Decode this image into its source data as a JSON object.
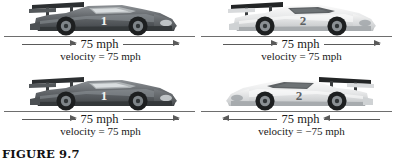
{
  "figure": {
    "caption": "FIGURE 9.7",
    "background_color": "#ffffff",
    "line_color": "#6e6e6e",
    "arrow_color": "#5a5a5a"
  },
  "panels": [
    {
      "id": "top-left",
      "car_number": "1",
      "car_color": "#5b5f63",
      "car_tone": "dark",
      "facing": "right",
      "arrow_direction": "right",
      "speed_label": "75 mph",
      "velocity_label": "velocity = 75 mph"
    },
    {
      "id": "top-right",
      "car_number": "2",
      "car_color": "#e8e8e8",
      "car_tone": "light",
      "facing": "right",
      "arrow_direction": "right",
      "speed_label": "75 mph",
      "velocity_label": "velocity = 75 mph"
    },
    {
      "id": "bottom-left",
      "car_number": "1",
      "car_color": "#5b5f63",
      "car_tone": "dark",
      "facing": "right",
      "arrow_direction": "right",
      "speed_label": "75 mph",
      "velocity_label": "velocity = 75 mph"
    },
    {
      "id": "bottom-right",
      "car_number": "2",
      "car_color": "#e8e8e8",
      "car_tone": "light",
      "facing": "left",
      "arrow_direction": "left",
      "speed_label": "75 mph",
      "velocity_label": "velocity = −75 mph"
    }
  ]
}
